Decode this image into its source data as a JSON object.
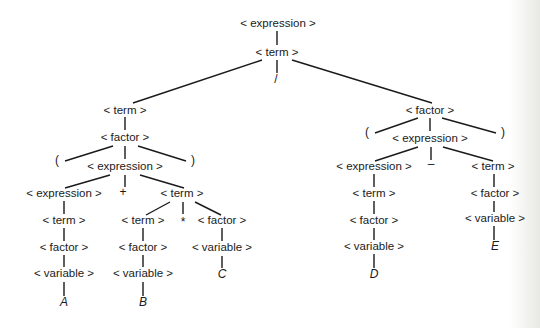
{
  "diagram": {
    "type": "parse-tree",
    "expression": "(A + B * C) / (D - E)",
    "nodes": [
      {
        "id": "n0",
        "label": "< expression >",
        "x": 278,
        "y": 27,
        "kind": "nonterminal"
      },
      {
        "id": "n1",
        "label": "< term >",
        "x": 277,
        "y": 56,
        "kind": "nonterminal"
      },
      {
        "id": "n2",
        "label": "/",
        "x": 276,
        "y": 83,
        "kind": "operator"
      },
      {
        "id": "n3",
        "label": "< term >",
        "x": 125,
        "y": 114,
        "kind": "nonterminal"
      },
      {
        "id": "n4",
        "label": "< factor >",
        "x": 125,
        "y": 141,
        "kind": "nonterminal"
      },
      {
        "id": "n5",
        "label": "(",
        "x": 57,
        "y": 164,
        "kind": "operator"
      },
      {
        "id": "n6",
        "label": "< expression >",
        "x": 125,
        "y": 170,
        "kind": "nonterminal"
      },
      {
        "id": "n7",
        "label": ")",
        "x": 193,
        "y": 164,
        "kind": "operator"
      },
      {
        "id": "n8",
        "label": "< expression >",
        "x": 64,
        "y": 197,
        "kind": "nonterminal"
      },
      {
        "id": "n9",
        "label": "+",
        "x": 123,
        "y": 196,
        "kind": "operator"
      },
      {
        "id": "n10",
        "label": "< term >",
        "x": 182,
        "y": 197,
        "kind": "nonterminal"
      },
      {
        "id": "n11",
        "label": "< term >",
        "x": 64,
        "y": 224,
        "kind": "nonterminal"
      },
      {
        "id": "n12",
        "label": "< term >",
        "x": 143,
        "y": 224,
        "kind": "nonterminal"
      },
      {
        "id": "n13",
        "label": "*",
        "x": 183,
        "y": 226,
        "kind": "operator"
      },
      {
        "id": "n14",
        "label": "< factor >",
        "x": 222,
        "y": 224,
        "kind": "nonterminal"
      },
      {
        "id": "n15",
        "label": "< factor >",
        "x": 64,
        "y": 251,
        "kind": "nonterminal"
      },
      {
        "id": "n16",
        "label": "< factor >",
        "x": 143,
        "y": 251,
        "kind": "nonterminal"
      },
      {
        "id": "n17",
        "label": "< variable >",
        "x": 222,
        "y": 251,
        "kind": "nonterminal"
      },
      {
        "id": "n18",
        "label": "< variable >",
        "x": 64,
        "y": 277,
        "kind": "nonterminal"
      },
      {
        "id": "n19",
        "label": "< variable >",
        "x": 143,
        "y": 277,
        "kind": "nonterminal"
      },
      {
        "id": "n20",
        "label": "C",
        "x": 222,
        "y": 278,
        "kind": "leaf"
      },
      {
        "id": "n21",
        "label": "A",
        "x": 64,
        "y": 306,
        "kind": "leaf"
      },
      {
        "id": "n22",
        "label": "B",
        "x": 143,
        "y": 306,
        "kind": "leaf"
      },
      {
        "id": "n23",
        "label": "< factor >",
        "x": 430,
        "y": 114,
        "kind": "nonterminal"
      },
      {
        "id": "n24",
        "label": "(",
        "x": 367,
        "y": 136,
        "kind": "operator"
      },
      {
        "id": "n25",
        "label": "< expression >",
        "x": 430,
        "y": 142,
        "kind": "nonterminal"
      },
      {
        "id": "n26",
        "label": ")",
        "x": 503,
        "y": 136,
        "kind": "operator"
      },
      {
        "id": "n27",
        "label": "< expression >",
        "x": 374,
        "y": 170,
        "kind": "nonterminal"
      },
      {
        "id": "n28",
        "label": "–",
        "x": 431,
        "y": 168,
        "kind": "operator"
      },
      {
        "id": "n29",
        "label": "< term >",
        "x": 493,
        "y": 170,
        "kind": "nonterminal"
      },
      {
        "id": "n30",
        "label": "< term >",
        "x": 374,
        "y": 197,
        "kind": "nonterminal"
      },
      {
        "id": "n31",
        "label": "< factor >",
        "x": 495,
        "y": 197,
        "kind": "nonterminal"
      },
      {
        "id": "n32",
        "label": "< factor >",
        "x": 374,
        "y": 224,
        "kind": "nonterminal"
      },
      {
        "id": "n33",
        "label": "< variable >",
        "x": 495,
        "y": 222,
        "kind": "nonterminal"
      },
      {
        "id": "n34",
        "label": "< variable >",
        "x": 374,
        "y": 250,
        "kind": "nonterminal"
      },
      {
        "id": "n35",
        "label": "E",
        "x": 495,
        "y": 250,
        "kind": "leaf"
      },
      {
        "id": "n36",
        "label": "D",
        "x": 374,
        "y": 278,
        "kind": "leaf"
      }
    ],
    "edges": [
      {
        "x1": 277,
        "y1": 31,
        "x2": 277,
        "y2": 45
      },
      {
        "x1": 277,
        "y1": 60,
        "x2": 277,
        "y2": 73
      },
      {
        "x1": 262,
        "y1": 60,
        "x2": 133,
        "y2": 103
      },
      {
        "x1": 292,
        "y1": 60,
        "x2": 432,
        "y2": 103
      },
      {
        "x1": 125,
        "y1": 117,
        "x2": 125,
        "y2": 130
      },
      {
        "x1": 113,
        "y1": 146,
        "x2": 65,
        "y2": 161
      },
      {
        "x1": 125,
        "y1": 146,
        "x2": 125,
        "y2": 159
      },
      {
        "x1": 138,
        "y1": 146,
        "x2": 186,
        "y2": 161
      },
      {
        "x1": 110,
        "y1": 175,
        "x2": 65,
        "y2": 188
      },
      {
        "x1": 125,
        "y1": 175,
        "x2": 125,
        "y2": 187
      },
      {
        "x1": 140,
        "y1": 175,
        "x2": 184,
        "y2": 188
      },
      {
        "x1": 64,
        "y1": 201,
        "x2": 64,
        "y2": 214
      },
      {
        "x1": 170,
        "y1": 202,
        "x2": 146,
        "y2": 215
      },
      {
        "x1": 183,
        "y1": 202,
        "x2": 183,
        "y2": 214
      },
      {
        "x1": 195,
        "y1": 202,
        "x2": 221,
        "y2": 215
      },
      {
        "x1": 64,
        "y1": 228,
        "x2": 64,
        "y2": 241
      },
      {
        "x1": 143,
        "y1": 228,
        "x2": 143,
        "y2": 241
      },
      {
        "x1": 222,
        "y1": 228,
        "x2": 222,
        "y2": 241
      },
      {
        "x1": 64,
        "y1": 255,
        "x2": 64,
        "y2": 267
      },
      {
        "x1": 143,
        "y1": 255,
        "x2": 143,
        "y2": 267
      },
      {
        "x1": 222,
        "y1": 256,
        "x2": 222,
        "y2": 268
      },
      {
        "x1": 64,
        "y1": 282,
        "x2": 64,
        "y2": 296
      },
      {
        "x1": 143,
        "y1": 282,
        "x2": 143,
        "y2": 296
      },
      {
        "x1": 418,
        "y1": 118,
        "x2": 375,
        "y2": 133
      },
      {
        "x1": 430,
        "y1": 118,
        "x2": 430,
        "y2": 131
      },
      {
        "x1": 442,
        "y1": 118,
        "x2": 496,
        "y2": 133
      },
      {
        "x1": 418,
        "y1": 147,
        "x2": 375,
        "y2": 161
      },
      {
        "x1": 431,
        "y1": 147,
        "x2": 431,
        "y2": 160
      },
      {
        "x1": 443,
        "y1": 147,
        "x2": 493,
        "y2": 161
      },
      {
        "x1": 374,
        "y1": 174,
        "x2": 374,
        "y2": 187
      },
      {
        "x1": 494,
        "y1": 174,
        "x2": 494,
        "y2": 187
      },
      {
        "x1": 374,
        "y1": 201,
        "x2": 374,
        "y2": 214
      },
      {
        "x1": 494,
        "y1": 201,
        "x2": 494,
        "y2": 212
      },
      {
        "x1": 374,
        "y1": 228,
        "x2": 374,
        "y2": 240
      },
      {
        "x1": 494,
        "y1": 226,
        "x2": 494,
        "y2": 240
      },
      {
        "x1": 374,
        "y1": 254,
        "x2": 374,
        "y2": 268
      }
    ]
  },
  "colors": {
    "background": "#ffffff",
    "ink": "#1a1a1a",
    "edge_shade": "#e8e8e4"
  }
}
